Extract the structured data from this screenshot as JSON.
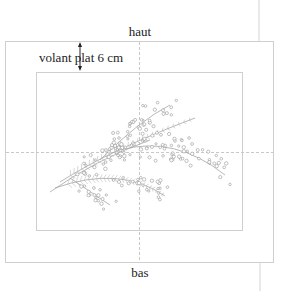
{
  "labels": {
    "top": "haut",
    "bottom": "bas",
    "margin": "volant plat 6 cm"
  },
  "illustration": {
    "subject": "mimosa-branch",
    "style": "line-drawing"
  },
  "colors": {
    "text": "#222222",
    "frame": "#cfcfcf",
    "guide": "#c8c8c8",
    "drawing": "#8f8f8f"
  }
}
